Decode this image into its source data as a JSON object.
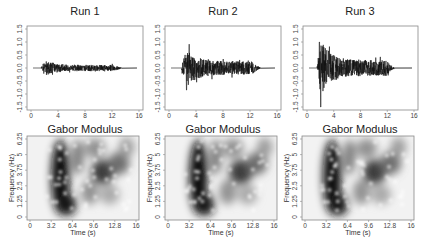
{
  "chart_data": [
    {
      "type": "line",
      "title": "Run 1",
      "xlabel": "",
      "ylabel": "",
      "xlim": [
        0,
        16
      ],
      "ylim": [
        -1.5,
        1.5
      ],
      "x_ticks": [
        "0",
        "4",
        "8",
        "12",
        "16"
      ],
      "y_ticks": [
        "-1.5",
        "-1.0",
        "-0.5",
        "0.0",
        "0.5",
        "1.0",
        "1.5"
      ],
      "description": "Acceleration time history; burst of activity from ~1.5 s to ~13.5 s, peak amplitude approx ±0.3",
      "amplitude_envelope": {
        "start": 1.5,
        "peak_time": 2.0,
        "peak": 0.3,
        "end": 13.5,
        "tail": 0.12
      }
    },
    {
      "type": "line",
      "title": "Run 2",
      "xlabel": "",
      "ylabel": "",
      "xlim": [
        0,
        16
      ],
      "ylim": [
        -1.5,
        1.5
      ],
      "x_ticks": [
        "0",
        "4",
        "8",
        "12",
        "16"
      ],
      "y_ticks": [
        "-1.5",
        "-1.0",
        "-0.5",
        "0.0",
        "0.5",
        "1.0",
        "1.5"
      ],
      "description": "Acceleration time history; onset ~1.8 s, peak amplitude approx 0.6 / -0.8, decaying to ~13.5 s",
      "amplitude_envelope": {
        "start": 1.8,
        "peak_time": 2.5,
        "peak": 0.75,
        "end": 13.5,
        "tail": 0.25
      }
    },
    {
      "type": "line",
      "title": "Run 3",
      "xlabel": "",
      "ylabel": "",
      "xlim": [
        0,
        16
      ],
      "ylim": [
        -1.5,
        1.5
      ],
      "x_ticks": [
        "0",
        "4",
        "8",
        "12",
        "16"
      ],
      "y_ticks": [
        "-1.5",
        "-1.0",
        "-0.5",
        "0.0",
        "0.5",
        "1.0",
        "1.5"
      ],
      "description": "Acceleration time history; onset ~1.5 s, peak approx 1.0 and -1.6 near 2 s, decaying to ~13 s",
      "amplitude_envelope": {
        "start": 1.5,
        "peak_time": 2.0,
        "peak": 1.1,
        "end": 13.0,
        "tail": 0.3
      }
    },
    {
      "type": "heatmap",
      "title": "Gabor Modulus",
      "xlabel": "Time (s)",
      "ylabel": "Frequency (Hz)",
      "xlim": [
        0,
        16
      ],
      "ylim": [
        0,
        6.25
      ],
      "x_ticks": [
        "0",
        "3.2",
        "6.4",
        "9.6",
        "12.8",
        "16"
      ],
      "y_ticks": [
        "0",
        "1.25",
        "2.5",
        "3.75",
        "5",
        "6.25"
      ],
      "colormap": "grayscale (dark = high modulus)",
      "description": "Strong energy band from ~3 s to ~7 s across 0.5–6.25 Hz, secondary region near 10–13 s around 3–4.5 Hz"
    },
    {
      "type": "heatmap",
      "title": "Gabor Modulus",
      "xlabel": "Time (s)",
      "ylabel": "Frequency (Hz)",
      "xlim": [
        0,
        16
      ],
      "ylim": [
        0,
        6.25
      ],
      "x_ticks": [
        "0",
        "3.2",
        "6.4",
        "9.6",
        "12.8",
        "16"
      ],
      "y_ticks": [
        "0",
        "1.25",
        "2.5",
        "3.75",
        "5",
        "6.25"
      ],
      "colormap": "grayscale (dark = high modulus)",
      "description": "Similar to first: dark band ~3–7 s, secondary dark region ~10–13 s near 3.5 Hz"
    },
    {
      "type": "heatmap",
      "title": "Gabor Modulus",
      "xlabel": "Time (s)",
      "ylabel": "Frequency (Hz)",
      "xlim": [
        0,
        16
      ],
      "ylim": [
        0,
        6.25
      ],
      "x_ticks": [
        "0",
        "3.2",
        "6.4",
        "9.6",
        "12.8",
        "16"
      ],
      "y_ticks": [
        "0",
        "1.25",
        "2.5",
        "3.75",
        "5",
        "6.25"
      ],
      "colormap": "grayscale (dark = high modulus)",
      "description": "Dark band ~2.5–6.5 s, secondary dark region ~10–13 s around 2.5–4.5 Hz"
    }
  ],
  "panels": {
    "top": [
      {
        "title": "Run 1"
      },
      {
        "title": "Run 2"
      },
      {
        "title": "Run 3"
      }
    ],
    "bottom": [
      {
        "title": "Gabor Modulus",
        "xlabel": "Time (s)",
        "ylabel": "Frequency (Hz)"
      },
      {
        "title": "Gabor Modulus",
        "xlabel": "Time (s)",
        "ylabel": "Frequency (Hz)"
      },
      {
        "title": "Gabor Modulus",
        "xlabel": "Time (s)",
        "ylabel": "Frequency (Hz)"
      }
    ],
    "top_x_ticks": [
      "0",
      "4",
      "8",
      "12",
      "16"
    ],
    "top_y_ticks": [
      "-1.5",
      "-1.0",
      "-0.5",
      "0.0",
      "0.5",
      "1.0",
      "1.5"
    ],
    "bottom_x_ticks": [
      "0",
      "3.2",
      "6.4",
      "9.6",
      "12.8",
      "16"
    ],
    "bottom_y_ticks": [
      "0",
      "1.25",
      "2.5",
      "3.75",
      "5",
      "6.25"
    ]
  },
  "colors": {
    "axis": "#888888",
    "trace": "#111111",
    "baseline": "#999999"
  }
}
